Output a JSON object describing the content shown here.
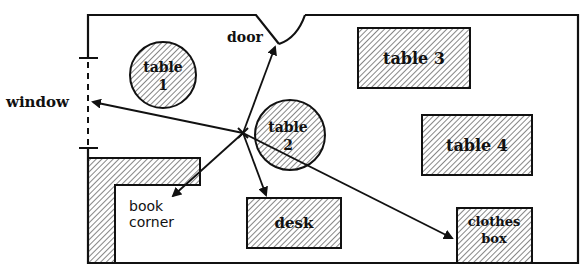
{
  "diagram": {
    "type": "classroom floor plan",
    "colors": {
      "ink": "#111111",
      "background": "#ffffff",
      "hatch": "#222222"
    },
    "labels": {
      "window": "window",
      "door": "door",
      "book_corner_line1": "book",
      "book_corner_line2": "corner",
      "table1_line1": "table",
      "table1_line2": "1",
      "table2_line1": "table",
      "table2_line2": "2",
      "table3": "table 3",
      "table4": "table 4",
      "desk": "desk",
      "clothes_box_line1": "clothes",
      "clothes_box_line2": "box",
      "position_marker": "x"
    },
    "furniture": [
      {
        "name": "table 1",
        "shape": "circle",
        "hatched": true
      },
      {
        "name": "table 2",
        "shape": "circle",
        "hatched": true
      },
      {
        "name": "table 3",
        "shape": "rectangle",
        "hatched": true
      },
      {
        "name": "table 4",
        "shape": "rectangle",
        "hatched": true
      },
      {
        "name": "desk",
        "shape": "rectangle",
        "hatched": true
      },
      {
        "name": "clothes box",
        "shape": "rectangle",
        "hatched": true
      },
      {
        "name": "book corner",
        "shape": "L-shape",
        "hatched": true
      }
    ],
    "arrows_from_marker_to": [
      "door",
      "window",
      "book corner",
      "desk",
      "clothes box"
    ]
  }
}
